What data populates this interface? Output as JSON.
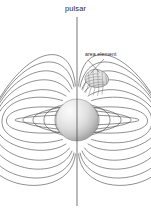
{
  "figure": {
    "name": "pulsar-magnetic-dipole-field-diagram",
    "background_color": "#ffffff",
    "width": 151,
    "height": 218
  },
  "labels": {
    "pulsar": "pulsar",
    "area_element": "area element"
  },
  "colors": {
    "line": "#4a4a4a",
    "axis": "#3c3c3c",
    "text": "#2b2b2b",
    "sphere_highlight": "#f4f4f4",
    "sphere_mid": "#cfcfcf",
    "sphere_edge": "#9a9a9a",
    "sphere_outline": "#8d8d8d",
    "patch_fill": "#dcdcdc",
    "patch_outline": "#6e6e6e",
    "leader": "#555555"
  },
  "star": {
    "label": "neutron star body",
    "center_x": 77,
    "center_y": 120,
    "radius": 21,
    "shading": "radial-gradient, highlight upper-left"
  },
  "axis": {
    "label": "magnetic rotation axis",
    "x": 77,
    "y_top": 17,
    "y_bottom": 206
  },
  "area_element_patch": {
    "label": "area element patch on stellar surface",
    "center_x": 97,
    "center_y": 79,
    "hatching": true
  },
  "leader_lines": [
    {
      "name": "leader-line-left",
      "x1": 88,
      "y1": 60,
      "x2": 99,
      "y2": 72
    },
    {
      "name": "leader-line-right",
      "x1": 104,
      "y1": 59,
      "x2": 91,
      "y2": 73
    }
  ],
  "field_lines": {
    "description": "Dipole magnetic field lines emerging from the poles of the neutron star, closed loops near the star and open lines sweeping to the frame edges.",
    "count_per_side": 12,
    "symmetry": "mirror symmetric about vertical axis and horizontal equator",
    "loop_apex_distances": [
      30,
      45,
      62,
      82,
      104,
      128,
      155,
      185,
      215,
      250,
      290,
      330
    ]
  }
}
